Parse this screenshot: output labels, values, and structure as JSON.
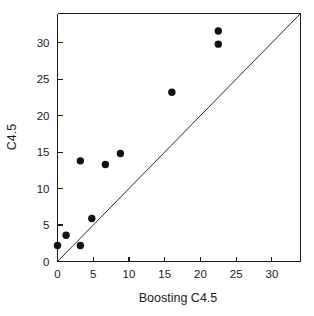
{
  "chart_data": {
    "type": "scatter",
    "title": "",
    "xlabel": "Boosting C4.5",
    "ylabel": "C4.5",
    "xlim": [
      0,
      34
    ],
    "ylim": [
      0,
      34
    ],
    "grid": false,
    "legend": null,
    "xticks": [
      0,
      5,
      10,
      15,
      20,
      25,
      30
    ],
    "yticks": [
      0,
      5,
      10,
      15,
      20,
      25,
      30
    ],
    "xticklabels": [
      "0",
      "5",
      "10",
      "15",
      "20",
      "25",
      "30"
    ],
    "yticklabels": [
      "0",
      "5",
      "10",
      "15",
      "20",
      "25",
      "30"
    ],
    "marker": "filled-circle",
    "marker_color": "#111111",
    "points": [
      {
        "x": 0.0,
        "y": 2.2
      },
      {
        "x": 1.2,
        "y": 3.6
      },
      {
        "x": 3.2,
        "y": 2.2
      },
      {
        "x": 3.2,
        "y": 13.8
      },
      {
        "x": 4.8,
        "y": 5.9
      },
      {
        "x": 6.7,
        "y": 13.3
      },
      {
        "x": 8.8,
        "y": 14.8
      },
      {
        "x": 16.0,
        "y": 23.2
      },
      {
        "x": 22.5,
        "y": 31.6
      },
      {
        "x": 22.5,
        "y": 29.8
      }
    ],
    "reference_line": {
      "name": "identity",
      "from": [
        0,
        0
      ],
      "to": [
        34,
        34
      ],
      "color": "#2b2b2b"
    }
  }
}
